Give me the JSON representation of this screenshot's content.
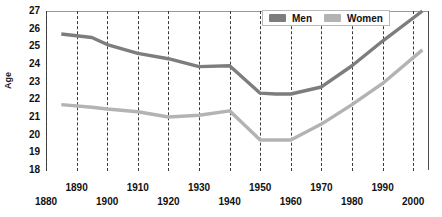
{
  "chart_data": {
    "type": "line",
    "title": "",
    "subtitle": "",
    "xlabel": "",
    "ylabel": "Age",
    "xlim": [
      1880,
      2005
    ],
    "ylim": [
      18,
      27
    ],
    "grid": "vertical dashed gridlines at every decade",
    "legend_position": "top-right inside plot area",
    "y_ticks": [
      27,
      26,
      25,
      24,
      23,
      22,
      21,
      20,
      19,
      18
    ],
    "x_ticks": [
      1880,
      1890,
      1900,
      1910,
      1920,
      1930,
      1940,
      1950,
      1960,
      1970,
      1980,
      1990,
      2000
    ],
    "x_tick_rows": {
      "upper": [
        1890,
        1910,
        1930,
        1950,
        1970,
        1990
      ],
      "lower": [
        1880,
        1900,
        1920,
        1940,
        1960,
        1980,
        2000
      ]
    },
    "x": [
      1885,
      1895,
      1900,
      1910,
      1920,
      1930,
      1940,
      1950,
      1955,
      1960,
      1970,
      1980,
      1990,
      2003
    ],
    "series": [
      {
        "name": "Men",
        "color": "#7d7d7d",
        "values": [
          25.7,
          25.5,
          25.1,
          24.6,
          24.3,
          23.85,
          23.9,
          22.35,
          22.3,
          22.3,
          22.7,
          23.9,
          25.3,
          27.0
        ]
      },
      {
        "name": "Women",
        "color": "#b3b3b3",
        "values": [
          21.7,
          21.55,
          21.45,
          21.3,
          21.0,
          21.1,
          21.35,
          19.7,
          19.7,
          19.7,
          20.6,
          21.7,
          22.9,
          24.8
        ]
      }
    ]
  },
  "legend": {
    "items": [
      {
        "label": "Men",
        "color": "#7d7d7d"
      },
      {
        "label": "Women",
        "color": "#b3b3b3"
      }
    ]
  },
  "axes": {
    "y_axis_title": "Age"
  }
}
